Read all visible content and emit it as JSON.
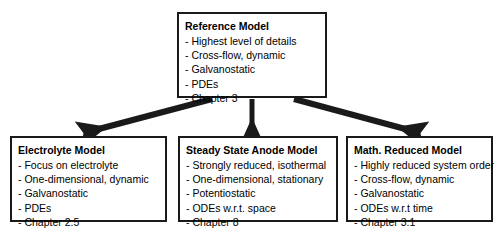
{
  "diagram": {
    "type": "hierarchy-flowchart",
    "colors": {
      "border": "#1a1a1a",
      "background": "#ffffff",
      "text": "#000000",
      "arrow": "#1a1a1a"
    },
    "nodes": [
      {
        "id": "reference",
        "title": "Reference Model",
        "items": [
          "- Highest level of details",
          "- Cross-flow, dynamic",
          "- Galvanostatic",
          "- PDEs",
          "- Chapter 3"
        ]
      },
      {
        "id": "electrolyte",
        "title": "Electrolyte Model",
        "items": [
          "- Focus on electrolyte",
          "- One-dimensional, dynamic",
          "- Galvanostatic",
          "- PDEs",
          "- Chapter 2.5"
        ]
      },
      {
        "id": "steady_state",
        "title": "Steady State Anode Model",
        "items": [
          "- Strongly reduced, isothermal",
          "- One-dimensional, stationary",
          "- Potentiostatic",
          "- ODEs w.r.t. space",
          "- Chapter 8"
        ]
      },
      {
        "id": "math_reduced",
        "title": "Math. Reduced Model",
        "items": [
          "- Highly reduced system order",
          "- Cross-flow, dynamic",
          "- Galvanostatic",
          "- ODEs w.r.t time",
          "- Chapter 3.1"
        ]
      }
    ],
    "edges": [
      {
        "id": "edge-reference-to-electrolyte",
        "from": "reference",
        "to": "electrolyte"
      },
      {
        "id": "edge-reference-to-steady-state",
        "from": "reference",
        "to": "steady_state"
      },
      {
        "id": "edge-reference-to-math-reduced",
        "from": "reference",
        "to": "math_reduced"
      }
    ]
  }
}
